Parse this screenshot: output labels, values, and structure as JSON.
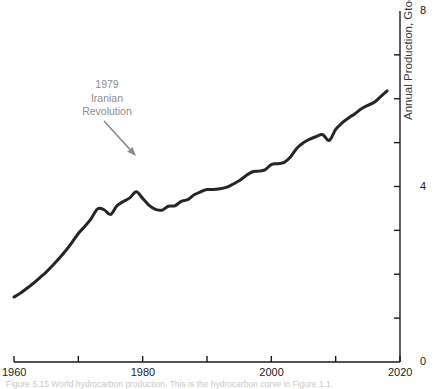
{
  "figure": {
    "caption": "Figure 5.15  World hydrocarbon production. This is the hydrocarbon curve in Figure 1.1."
  },
  "annotation": {
    "name": "iranian-revolution-annotation",
    "lines": [
      "1979",
      "Iranian",
      "Revolution"
    ],
    "color": "#8d8d8d",
    "arrow": {
      "x1": 104,
      "y1": 121,
      "x2": 136,
      "y2": 156
    }
  },
  "chart_data": {
    "type": "line",
    "title": "",
    "subtitle": "",
    "xlabel": "",
    "ylabel": "Annual Production, Gtoe",
    "xlim": [
      1960,
      2020
    ],
    "ylim": [
      0,
      8
    ],
    "grid": false,
    "legend": null,
    "line_color": "#262626",
    "line_width": 3.0,
    "y_axis_position": "right",
    "x_ticks": [
      1960,
      1970,
      1980,
      1990,
      2000,
      2010,
      2020
    ],
    "x_tick_labels": [
      "1960",
      "",
      "1980",
      "",
      "2000",
      "",
      "2020"
    ],
    "x_labeled_ticks": [
      {
        "value": 1960,
        "label": "1960"
      },
      {
        "value": 1980,
        "label": "1980"
      },
      {
        "value": 2000,
        "label": "2000"
      },
      {
        "value": 2020,
        "label": "2020"
      }
    ],
    "y_ticks": [
      0,
      1,
      2,
      3,
      4,
      5,
      6,
      7,
      8
    ],
    "y_labeled_ticks": [
      {
        "value": 0,
        "label": "0"
      },
      {
        "value": 4,
        "label": "4"
      },
      {
        "value": 8,
        "label": "8"
      }
    ],
    "series": [
      {
        "name": "World hydrocarbon production",
        "units": "Gtoe",
        "x": [
          1960,
          1961,
          1962,
          1963,
          1964,
          1965,
          1966,
          1967,
          1968,
          1969,
          1970,
          1971,
          1972,
          1973,
          1974,
          1975,
          1976,
          1977,
          1978,
          1979,
          1980,
          1981,
          1982,
          1983,
          1984,
          1985,
          1986,
          1987,
          1988,
          1989,
          1990,
          1991,
          1992,
          1993,
          1994,
          1995,
          1996,
          1997,
          1998,
          1999,
          2000,
          2001,
          2002,
          2003,
          2004,
          2005,
          2006,
          2007,
          2008,
          2009,
          2010,
          2011,
          2012,
          2013,
          2014,
          2015,
          2016,
          2017,
          2018
        ],
        "values": [
          1.48,
          1.57,
          1.68,
          1.79,
          1.92,
          2.05,
          2.2,
          2.36,
          2.53,
          2.72,
          2.93,
          3.09,
          3.27,
          3.49,
          3.47,
          3.36,
          3.56,
          3.66,
          3.74,
          3.88,
          3.73,
          3.57,
          3.48,
          3.46,
          3.55,
          3.56,
          3.66,
          3.7,
          3.81,
          3.88,
          3.93,
          3.93,
          3.95,
          3.98,
          4.05,
          4.13,
          4.24,
          4.33,
          4.35,
          4.38,
          4.5,
          4.52,
          4.55,
          4.68,
          4.88,
          5.0,
          5.08,
          5.14,
          5.18,
          5.05,
          5.3,
          5.45,
          5.56,
          5.66,
          5.77,
          5.85,
          5.92,
          6.05,
          6.18
        ]
      }
    ],
    "annotations": [
      {
        "text": "1979 Iranian Revolution",
        "target_x": 1979,
        "target_y": 3.88
      }
    ]
  }
}
